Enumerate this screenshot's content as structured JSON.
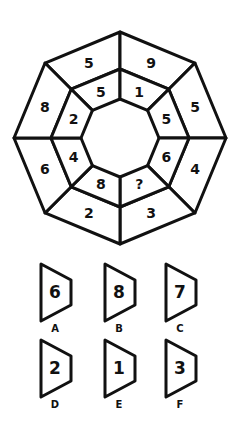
{
  "puzzle": {
    "center": [
      120,
      138
    ],
    "radii": {
      "outer": 106,
      "middle": 69,
      "inner": 39
    },
    "outer_ring": [
      {
        "position": "top-left",
        "value": "5"
      },
      {
        "position": "top-right",
        "value": "9"
      },
      {
        "position": "right-upper",
        "value": "5"
      },
      {
        "position": "right-lower",
        "value": "4"
      },
      {
        "position": "bottom-right",
        "value": "3"
      },
      {
        "position": "bottom-left",
        "value": "2"
      },
      {
        "position": "left-lower",
        "value": "6"
      },
      {
        "position": "left-upper",
        "value": "8"
      }
    ],
    "inner_ring": [
      {
        "position": "top-left",
        "value": "5"
      },
      {
        "position": "top-right",
        "value": "1"
      },
      {
        "position": "right-upper",
        "value": "5"
      },
      {
        "position": "right-lower",
        "value": "6"
      },
      {
        "position": "bottom-right",
        "value": "?"
      },
      {
        "position": "bottom-left",
        "value": "8"
      },
      {
        "position": "left-lower",
        "value": "4"
      },
      {
        "position": "left-upper",
        "value": "2"
      }
    ]
  },
  "options": [
    {
      "label": "A",
      "value": "6"
    },
    {
      "label": "B",
      "value": "8"
    },
    {
      "label": "C",
      "value": "7"
    },
    {
      "label": "D",
      "value": "2"
    },
    {
      "label": "E",
      "value": "1"
    },
    {
      "label": "F",
      "value": "3"
    }
  ]
}
